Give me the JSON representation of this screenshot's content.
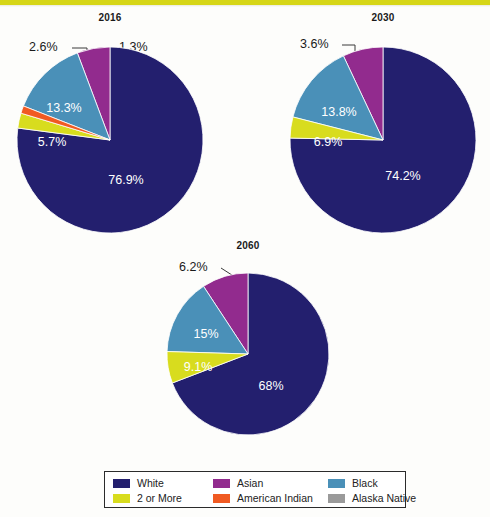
{
  "page": {
    "background_color": "#fdfdfb",
    "accent_band_color": "#d6d617"
  },
  "colors": {
    "white_race": "#231f6e",
    "asian": "#922b8e",
    "black": "#4a90b8",
    "two_or_more": "#d8dc1e",
    "american_indian": "#f05a22",
    "alaska_native": "#9a9a9a"
  },
  "legend": {
    "items": [
      {
        "label": "White",
        "color_key": "white_race",
        "color": "#231f6e"
      },
      {
        "label": "Asian",
        "color_key": "asian",
        "color": "#922b8e"
      },
      {
        "label": "Black",
        "color_key": "black",
        "color": "#4a90b8"
      },
      {
        "label": "2 or More",
        "color_key": "two_or_more",
        "color": "#d8dc1e"
      },
      {
        "label": "American Indian",
        "color_key": "american_indian",
        "color": "#f05a22"
      },
      {
        "label": "Alaska Native",
        "color_key": "alaska_native",
        "color": "#9a9a9a"
      }
    ]
  },
  "charts": [
    {
      "title": "2016",
      "labels": {
        "white": "76.9%",
        "black": "13.3%",
        "asian": "5.7%",
        "two_or_more": "2.6%",
        "american_indian": "1.3%"
      }
    },
    {
      "title": "2030",
      "labels": {
        "white": "74.2%",
        "black": "13.8%",
        "asian": "6.9%",
        "two_or_more": "3.6%"
      }
    },
    {
      "title": "2060",
      "labels": {
        "white": "68%",
        "black": "15%",
        "asian": "9.1%",
        "two_or_more": "6.2%"
      }
    }
  ],
  "chart_data": [
    {
      "type": "pie",
      "title": "2016",
      "categories": [
        "White",
        "2 or More",
        "American Indian",
        "Black",
        "Asian"
      ],
      "values": [
        76.9,
        2.6,
        1.3,
        13.3,
        5.7
      ],
      "labels": [
        "76.9%",
        "2.6%",
        "1.3%",
        "13.3%",
        "5.7%"
      ],
      "colors": [
        "#231f6e",
        "#d8dc1e",
        "#f05a22",
        "#4a90b8",
        "#922b8e"
      ],
      "start_angle_deg": 0,
      "direction": "clockwise",
      "legend_position": "bottom"
    },
    {
      "type": "pie",
      "title": "2030",
      "categories": [
        "White",
        "2 or More",
        "Black",
        "Asian"
      ],
      "values": [
        74.2,
        3.6,
        13.8,
        6.9
      ],
      "labels": [
        "74.2%",
        "3.6%",
        "13.8%",
        "6.9%"
      ],
      "colors": [
        "#231f6e",
        "#d8dc1e",
        "#4a90b8",
        "#922b8e"
      ],
      "start_angle_deg": 0,
      "direction": "clockwise",
      "legend_position": "bottom"
    },
    {
      "type": "pie",
      "title": "2060",
      "categories": [
        "White",
        "2 or More",
        "Black",
        "Asian"
      ],
      "values": [
        68.0,
        6.2,
        15.0,
        9.1
      ],
      "labels": [
        "68%",
        "6.2%",
        "15%",
        "9.1%"
      ],
      "colors": [
        "#231f6e",
        "#d8dc1e",
        "#4a90b8",
        "#922b8e"
      ],
      "start_angle_deg": 0,
      "direction": "clockwise",
      "legend_position": "bottom"
    }
  ]
}
